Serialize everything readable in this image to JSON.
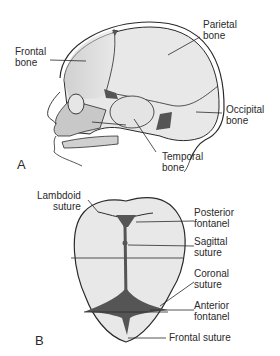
{
  "figure": {
    "panel_a": {
      "letter": "A",
      "view": "lateral skull",
      "labels": {
        "frontal": [
          "Frontal",
          "bone"
        ],
        "parietal": [
          "Parietal",
          "bone"
        ],
        "occipital": [
          "Occipital",
          "bone"
        ],
        "temporal": [
          "Temporal",
          "bone"
        ]
      }
    },
    "panel_b": {
      "letter": "B",
      "view": "superior skull",
      "labels": {
        "lambdoid": [
          "Lambdoid",
          "suture"
        ],
        "posterior_fontanel": [
          "Posterior",
          "fontanel"
        ],
        "sagittal": [
          "Sagittal",
          "suture"
        ],
        "coronal": [
          "Coronal",
          "suture"
        ],
        "anterior_fontanel": [
          "Anterior",
          "fontanel"
        ],
        "frontal_suture": "Frontal suture"
      }
    },
    "colors": {
      "bone_fill": "#e8e8e8",
      "bone_shade": "#c8c8c8",
      "fontanel": "#555555",
      "outline": "#2a2a2a"
    }
  }
}
